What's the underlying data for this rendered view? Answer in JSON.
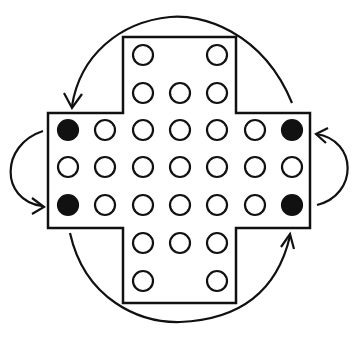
{
  "diagram": {
    "colors": {
      "ink": "#111111",
      "background": "#ffffff",
      "hole_fill": "#ffffff",
      "peg_fill": "#111111"
    },
    "board": {
      "outline_points": "123,37 236,37 236,113 310,113 310,228 236,228 236,303 123,303 123,228 48,228 48,113 123,113",
      "columns_x": [
        68,
        105,
        143,
        180,
        217,
        255,
        292
      ],
      "rows_y": [
        55,
        93,
        130,
        167,
        205,
        243,
        281
      ],
      "hole_radius": 10,
      "holes": [
        {
          "row": 0,
          "col": 2,
          "filled": false
        },
        {
          "row": 0,
          "col": 4,
          "filled": false
        },
        {
          "row": 1,
          "col": 2,
          "filled": false
        },
        {
          "row": 1,
          "col": 3,
          "filled": false
        },
        {
          "row": 1,
          "col": 4,
          "filled": false
        },
        {
          "row": 2,
          "col": 0,
          "filled": true
        },
        {
          "row": 2,
          "col": 1,
          "filled": false
        },
        {
          "row": 2,
          "col": 2,
          "filled": false
        },
        {
          "row": 2,
          "col": 3,
          "filled": false
        },
        {
          "row": 2,
          "col": 4,
          "filled": false
        },
        {
          "row": 2,
          "col": 5,
          "filled": false
        },
        {
          "row": 2,
          "col": 6,
          "filled": true
        },
        {
          "row": 3,
          "col": 0,
          "filled": false
        },
        {
          "row": 3,
          "col": 1,
          "filled": false
        },
        {
          "row": 3,
          "col": 2,
          "filled": false
        },
        {
          "row": 3,
          "col": 3,
          "filled": false
        },
        {
          "row": 3,
          "col": 4,
          "filled": false
        },
        {
          "row": 3,
          "col": 5,
          "filled": false
        },
        {
          "row": 3,
          "col": 6,
          "filled": false
        },
        {
          "row": 4,
          "col": 0,
          "filled": true
        },
        {
          "row": 4,
          "col": 1,
          "filled": false
        },
        {
          "row": 4,
          "col": 2,
          "filled": false
        },
        {
          "row": 4,
          "col": 3,
          "filled": false
        },
        {
          "row": 4,
          "col": 4,
          "filled": false
        },
        {
          "row": 4,
          "col": 5,
          "filled": false
        },
        {
          "row": 4,
          "col": 6,
          "filled": true
        },
        {
          "row": 5,
          "col": 2,
          "filled": false
        },
        {
          "row": 5,
          "col": 3,
          "filled": false
        },
        {
          "row": 5,
          "col": 4,
          "filled": false
        },
        {
          "row": 6,
          "col": 2,
          "filled": false
        },
        {
          "row": 6,
          "col": 4,
          "filled": false
        }
      ]
    },
    "arrows": [
      {
        "name": "top-arc-arrow",
        "path": "M 292 103 C 262 30 200 14 170 17 C 120 22 80 55 72 106",
        "head": "64,93 72,108 82,94"
      },
      {
        "name": "left-arc-arrow",
        "path": "M 43 131 C 0 145 0 200 42 206",
        "head": "32,198 44,207 32,214"
      },
      {
        "name": "right-arc-arrow",
        "path": "M 317 205 C 358 195 358 140 316 134",
        "head": "328,128 316,134 326,143"
      },
      {
        "name": "bottom-arc-arrow",
        "path": "M 70 233 C 85 300 140 323 180 322 C 230 320 275 300 290 236",
        "head": "281,247 290,234 294,249"
      }
    ]
  }
}
